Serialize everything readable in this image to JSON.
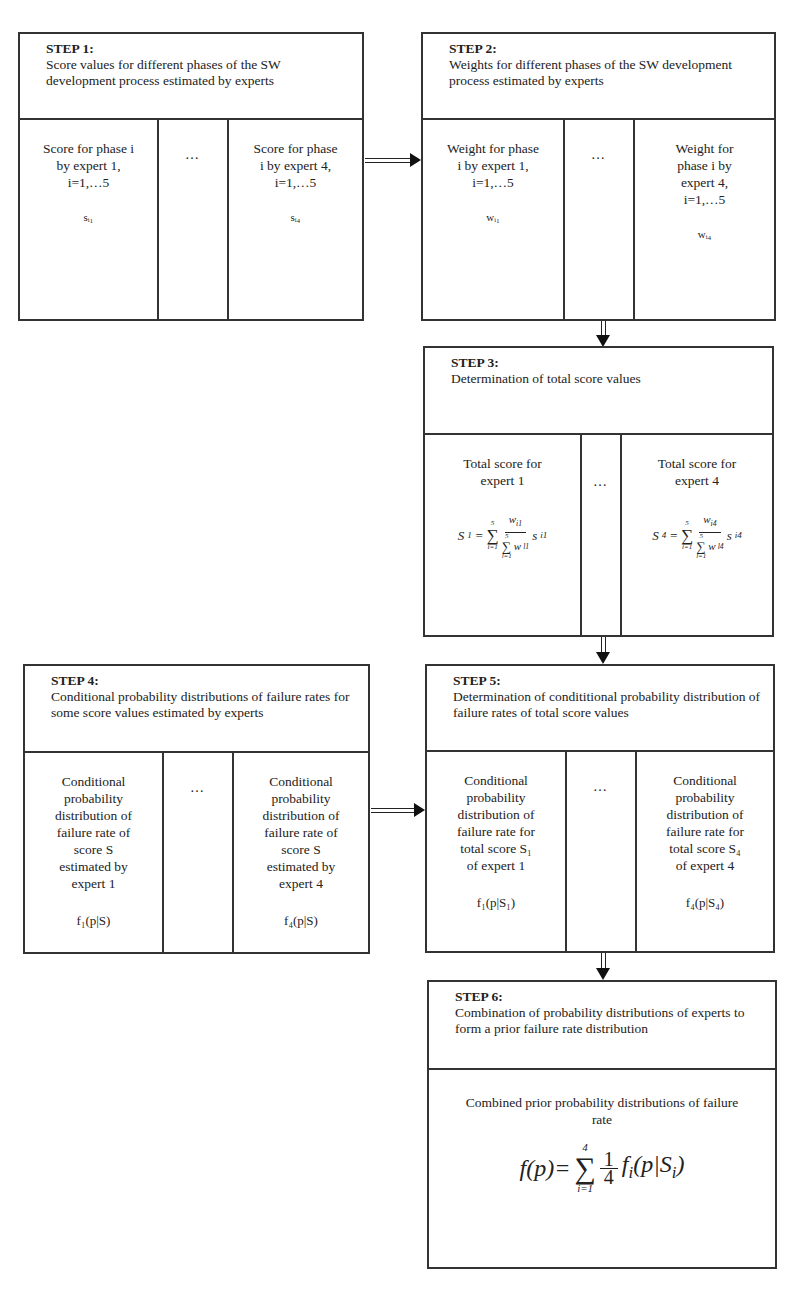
{
  "steps": [
    {
      "id": 1,
      "label": "STEP 1:",
      "title": "Score values for different phases of the SW development process estimated by experts",
      "columns": [
        {
          "text": "Score for phase i by expert 1, i=1,…5",
          "symbol": "sᵢ₁"
        },
        {
          "text": "…"
        },
        {
          "text": "Score for phase i by expert 4, i=1,…5",
          "symbol": "sᵢ₄"
        }
      ]
    },
    {
      "id": 2,
      "label": "STEP 2:",
      "title": "Weights for different phases of the SW development process estimated by experts",
      "columns": [
        {
          "text": "Weight for phase i by expert 1, i=1,…5",
          "symbol": "wᵢ₁"
        },
        {
          "text": "…"
        },
        {
          "text": "Weight for phase i by expert 4, i=1,…5",
          "symbol": "wᵢ₄"
        }
      ]
    },
    {
      "id": 3,
      "label": "STEP 3:",
      "title": "Determination of total score values",
      "columns": [
        {
          "text": "Total score for expert 1",
          "formula": {
            "lhs": "S",
            "lhs_sub": "1",
            "sum_upper": "5",
            "sum_lower": "i=1",
            "num": "w",
            "num_sub": "i1",
            "den_upper": "5",
            "den_lower": "l=1",
            "den": "w",
            "den_sub": "l1",
            "tail": "s",
            "tail_sub": "i1"
          }
        },
        {
          "text": "…"
        },
        {
          "text": "Total score for expert 4",
          "formula": {
            "lhs": "S",
            "lhs_sub": "4",
            "sum_upper": "5",
            "sum_lower": "i=1",
            "num": "w",
            "num_sub": "i4",
            "den_upper": "5",
            "den_lower": "l=1",
            "den": "w",
            "den_sub": "l4",
            "tail": "s",
            "tail_sub": "i4"
          }
        }
      ]
    },
    {
      "id": 4,
      "label": "STEP 4:",
      "title": "Conditional probability distributions of failure rates for some score values estimated by experts",
      "columns": [
        {
          "text": "Conditional probability distribution of failure rate of score S estimated by expert 1",
          "symbol": "f₁(p|S)"
        },
        {
          "text": "…"
        },
        {
          "text": "Conditional probability distribution of failure rate of score S estimated by expert 4",
          "symbol": "f₄(p|S)"
        }
      ]
    },
    {
      "id": 5,
      "label": "STEP 5:",
      "title": "Determination of condititional probability distribution of failure rates of total score values",
      "columns": [
        {
          "text": "Conditional probability distribution of failure rate for total score S₁ of expert 1",
          "symbol": "f₁(p|S₁)"
        },
        {
          "text": "…"
        },
        {
          "text": "Conditional probability distribution of failure rate for total score S₄ of expert 4",
          "symbol": "f₄(p|S₄)"
        }
      ]
    },
    {
      "id": 6,
      "label": "STEP 6:",
      "title": "Combination of probability distributions of experts to form a prior failure rate distribution",
      "body_text": "Combined prior probability distributions of failure rate",
      "formula": {
        "lhs": "f(p)=",
        "sum_upper": "4",
        "sum_lower": "i=1",
        "num": "1",
        "den": "4",
        "rhs": "f",
        "rhs_sub": "i",
        "arg": "(p|S",
        "arg_sub": "i",
        "arg_close": ")"
      }
    }
  ],
  "arrows": [
    {
      "from": 1,
      "to": 2,
      "direction": "right"
    },
    {
      "from": 2,
      "to": 3,
      "direction": "down"
    },
    {
      "from": 3,
      "to": 5,
      "direction": "down"
    },
    {
      "from": 4,
      "to": 5,
      "direction": "right"
    },
    {
      "from": 5,
      "to": 6,
      "direction": "down"
    }
  ]
}
